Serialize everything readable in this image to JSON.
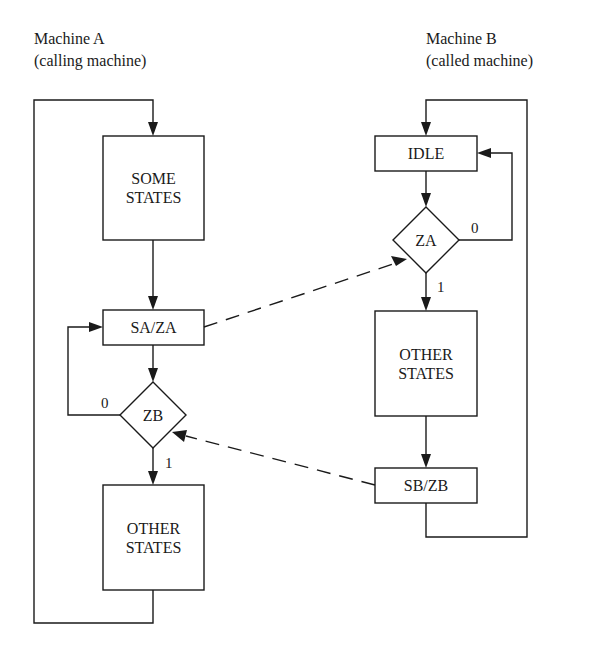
{
  "diagram": {
    "machine_a": {
      "title_line1": "Machine A",
      "title_line2": "(calling machine)",
      "nodes": {
        "some_states": {
          "line1": "SOME",
          "line2": "STATES"
        },
        "sa_za": {
          "label": "SA/ZA"
        },
        "zb": {
          "label": "ZB"
        },
        "other_states": {
          "line1": "OTHER",
          "line2": "STATES"
        }
      },
      "edge_labels": {
        "zb_false": "0",
        "zb_true": "1"
      }
    },
    "machine_b": {
      "title_line1": "Machine B",
      "title_line2": "(called machine)",
      "nodes": {
        "idle": {
          "label": "IDLE"
        },
        "za": {
          "label": "ZA"
        },
        "other_states": {
          "line1": "OTHER",
          "line2": "STATES"
        },
        "sb_zb": {
          "label": "SB/ZB"
        }
      },
      "edge_labels": {
        "za_false": "0",
        "za_true": "1"
      }
    },
    "colors": {
      "stroke": "#1a1a1a",
      "background": "#ffffff"
    }
  }
}
